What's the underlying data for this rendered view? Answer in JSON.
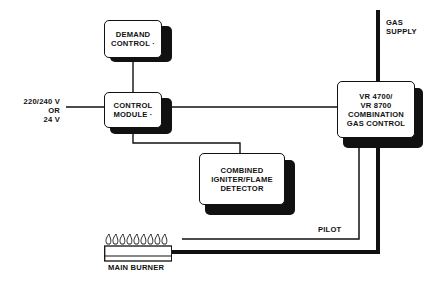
{
  "diagram": {
    "nodes": {
      "demand_control": {
        "line1": "DEMAND",
        "line2": "CONTROL ·"
      },
      "control_module": {
        "line1": "CONTROL",
        "line2": "MODULE ·"
      },
      "igniter": {
        "line1": "COMBINED",
        "line2": "IGNITER/FLAME",
        "line3": "DETECTOR"
      },
      "gas_control": {
        "line1": "VR 4700/",
        "line2": "VR 8700",
        "line3": "COMBINATION",
        "line4": "GAS CONTROL"
      },
      "main_burner": {
        "label": "MAIN BURNER",
        "flame_count": 9
      }
    },
    "labels": {
      "power": {
        "line1": "220/240 V",
        "line2": "OR",
        "line3": "24 V"
      },
      "gas_supply": {
        "line1": "GAS",
        "line2": "SUPPLY"
      },
      "pilot": "PILOT"
    },
    "edges": [
      {
        "from": "demand_control",
        "to": "control_module",
        "type": "electrical"
      },
      {
        "from": "power",
        "to": "control_module",
        "type": "electrical"
      },
      {
        "from": "control_module",
        "to": "gas_control",
        "type": "electrical"
      },
      {
        "from": "control_module",
        "to": "igniter",
        "type": "electrical"
      },
      {
        "from": "gas_supply",
        "to": "gas_control",
        "type": "gas-main"
      },
      {
        "from": "gas_control",
        "to": "main_burner",
        "type": "pilot"
      },
      {
        "from": "gas_control",
        "to": "main_burner",
        "type": "gas-main"
      }
    ],
    "colors": {
      "ink": "#111111",
      "background": "#ffffff"
    }
  }
}
